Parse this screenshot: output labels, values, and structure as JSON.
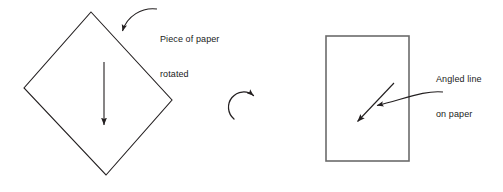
{
  "figure": {
    "background_color": "#ffffff",
    "stroke_color": "#231f20",
    "text_color": "#1a1a1a"
  },
  "annotations": {
    "rotated_paper": {
      "line1": "Piece of paper",
      "line2": "rotated",
      "text": "Piece of paper rotated"
    },
    "angled_line": {
      "line1": "Angled line",
      "line2": "on paper",
      "text": "Angled line on paper"
    }
  },
  "shapes": {
    "diamond": {
      "name": "rotated-square-paper",
      "points": "91,12 172,100 106,175 24,88",
      "stroke": "#231f20",
      "stroke_width": 1.1,
      "fill": "none"
    },
    "rectangle": {
      "name": "upright-paper",
      "x": 326,
      "y": 36,
      "width": 83,
      "height": 125,
      "stroke": "#6b6b6b",
      "stroke_width": 1.6,
      "fill": "none"
    }
  },
  "arrows": {
    "down_arrow": {
      "name": "downward-direction-arrow",
      "x1": 104,
      "y1": 62,
      "x2": 104,
      "y2": 128,
      "stroke": "#231f20"
    },
    "rotation_arrow": {
      "name": "clockwise-rotation-arrow",
      "center_x": 243,
      "center_y": 104,
      "radius": 15,
      "direction": "clockwise",
      "stroke": "#231f20"
    },
    "angled_arrow": {
      "name": "angled-line-on-paper-arrow",
      "x1": 394,
      "y1": 83,
      "x2": 355,
      "y2": 124,
      "stroke": "#231f20"
    },
    "callout_rotated": {
      "name": "callout-arrow-to-diamond",
      "from_x": 157,
      "from_y": 9,
      "to_x": 122,
      "to_y": 34,
      "stroke": "#231f20"
    },
    "callout_angled": {
      "name": "callout-arrow-to-angled-line",
      "from_x": 443,
      "from_y": 92,
      "to_x": 374,
      "to_y": 106,
      "stroke": "#231f20"
    }
  }
}
